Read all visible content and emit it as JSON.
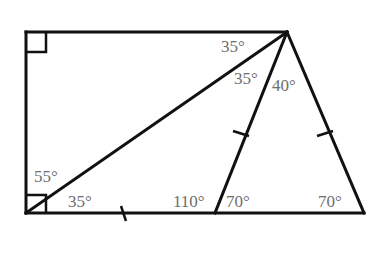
{
  "diagram": {
    "type": "geometry",
    "stroke_color": "#111111",
    "label_color": "#6e6e6e",
    "angles": {
      "top_apex_left": "35°",
      "top_apex_middle": "35°",
      "top_apex_right": "40°",
      "bottom_left_upper": "55°",
      "bottom_left_lower": "35°",
      "base_mid_left": "110°",
      "base_mid_right": "70°",
      "bottom_right": "70°"
    }
  }
}
